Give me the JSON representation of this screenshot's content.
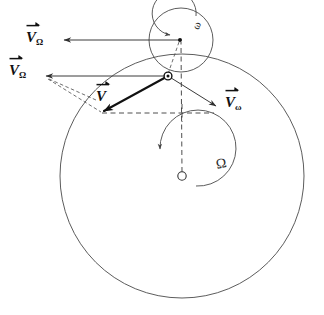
{
  "figure": {
    "labels": {
      "v_omega_cap_top": {
        "symbol": "V",
        "subscript": "Ω"
      },
      "v_omega_cap_mid": {
        "symbol": "V",
        "subscript": "Ω"
      },
      "v_total": {
        "symbol": "V",
        "subscript": ""
      },
      "v_omega_low": {
        "symbol": "V",
        "subscript": "ω"
      },
      "spin_small": "ω",
      "spin_large": "Ω"
    },
    "colors": {
      "background": "#ffffff",
      "curve_stroke": "#4a4a4a",
      "vector_stroke": "#111111",
      "dashed_stroke": "#3a3a3a"
    },
    "geometry": {
      "large_circle": {
        "cx": 182,
        "cy": 176,
        "r": 122
      },
      "small_circle": {
        "cx": 181,
        "cy": 40,
        "r": 32
      },
      "hub_point": {
        "x": 180,
        "y": 40
      },
      "particle_point": {
        "x": 168,
        "y": 76
      },
      "center_point": {
        "x": 182,
        "y": 176
      }
    },
    "vectors": [
      {
        "name": "V_Omega_top",
        "from": [
          180,
          40
        ],
        "to": [
          62,
          40
        ],
        "style": "thin"
      },
      {
        "name": "V_Omega_mid",
        "from": [
          168,
          76
        ],
        "to": [
          44,
          76
        ],
        "style": "thin"
      },
      {
        "name": "V_total",
        "from": [
          168,
          76
        ],
        "to": [
          101,
          113
        ],
        "style": "bold"
      },
      {
        "name": "V_omega",
        "from": [
          168,
          76
        ],
        "to": [
          218,
          107
        ],
        "style": "thin"
      }
    ]
  }
}
